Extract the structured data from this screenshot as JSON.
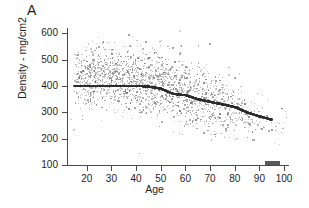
{
  "panel": {
    "label": "A"
  },
  "chart_data": {
    "type": "scatter",
    "title": "",
    "xlabel": "Age",
    "ylabel": "Density - mg/cm2",
    "xlim": [
      12,
      102
    ],
    "ylim": [
      100,
      620
    ],
    "xticks": [
      20,
      30,
      40,
      50,
      60,
      70,
      80,
      90,
      100
    ],
    "yticks": [
      100,
      200,
      300,
      400,
      500,
      600
    ],
    "grid": false,
    "legend": null,
    "series": [
      {
        "name": "Individual subjects",
        "marker": "dot",
        "color": "#707070",
        "note": "Dense cloud of several thousand points; density declines with age.",
        "density_profile": [
          {
            "age": 15,
            "mean": 430,
            "sd": 52,
            "n": 120
          },
          {
            "age": 20,
            "mean": 432,
            "sd": 55,
            "n": 300
          },
          {
            "age": 25,
            "mean": 430,
            "sd": 55,
            "n": 300
          },
          {
            "age": 30,
            "mean": 428,
            "sd": 56,
            "n": 300
          },
          {
            "age": 35,
            "mean": 424,
            "sd": 56,
            "n": 300
          },
          {
            "age": 40,
            "mean": 420,
            "sd": 57,
            "n": 300
          },
          {
            "age": 45,
            "mean": 412,
            "sd": 58,
            "n": 300
          },
          {
            "age": 50,
            "mean": 402,
            "sd": 60,
            "n": 300
          },
          {
            "age": 55,
            "mean": 388,
            "sd": 60,
            "n": 290
          },
          {
            "age": 60,
            "mean": 373,
            "sd": 60,
            "n": 270
          },
          {
            "age": 65,
            "mean": 358,
            "sd": 59,
            "n": 250
          },
          {
            "age": 70,
            "mean": 343,
            "sd": 57,
            "n": 220
          },
          {
            "age": 75,
            "mean": 328,
            "sd": 55,
            "n": 180
          },
          {
            "age": 80,
            "mean": 313,
            "sd": 52,
            "n": 140
          },
          {
            "age": 85,
            "mean": 298,
            "sd": 48,
            "n": 90
          },
          {
            "age": 90,
            "mean": 285,
            "sd": 44,
            "n": 45
          },
          {
            "age": 95,
            "mean": 272,
            "sd": 40,
            "n": 18
          },
          {
            "age": 100,
            "mean": 262,
            "sd": 36,
            "n": 5
          }
        ]
      },
      {
        "name": "Trend / median band",
        "marker": "filled-square",
        "color": "#2b2b2b",
        "x": [
          15,
          20,
          25,
          30,
          35,
          40,
          45,
          50,
          55,
          60,
          65,
          70,
          75,
          80,
          85,
          90,
          95
        ],
        "y": [
          400,
          400,
          400,
          400,
          400,
          400,
          398,
          390,
          370,
          365,
          350,
          340,
          330,
          320,
          300,
          285,
          272
        ]
      }
    ],
    "outliers": [
      {
        "age": 37,
        "density": 592
      },
      {
        "age": 44,
        "density": 566
      },
      {
        "age": 70,
        "density": 560
      },
      {
        "age": 25,
        "density": 548
      },
      {
        "age": 55,
        "density": 545
      }
    ]
  }
}
